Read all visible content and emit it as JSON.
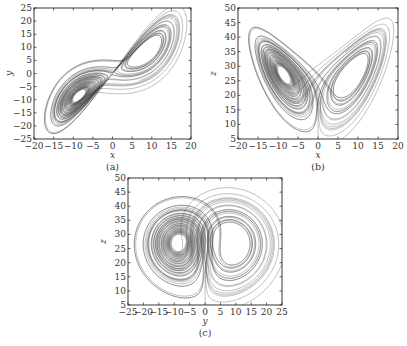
{
  "chart_data": [
    {
      "id": "a",
      "type": "line",
      "title": "",
      "caption": "(a)",
      "xlabel": "x",
      "ylabel": "y",
      "xlim": [
        -20,
        20
      ],
      "ylim": [
        -25,
        25
      ],
      "xticks": [
        -20,
        -15,
        -10,
        -5,
        0,
        5,
        10,
        15,
        20
      ],
      "yticks": [
        -25,
        -20,
        -15,
        -10,
        -5,
        0,
        5,
        10,
        15,
        20,
        25
      ],
      "grid": false,
      "series": [
        {
          "name": "Lorenz attractor projection x-y",
          "x_var": "x",
          "y_var": "y",
          "system": {
            "sigma": 10,
            "rho": 28,
            "beta": 2.6667
          }
        }
      ],
      "frame_px": {
        "left": 34,
        "top": 8,
        "right": 191,
        "bottom": 139
      }
    },
    {
      "id": "b",
      "type": "line",
      "title": "",
      "caption": "(b)",
      "xlabel": "x",
      "ylabel": "z",
      "xlim": [
        -20,
        20
      ],
      "ylim": [
        5,
        50
      ],
      "xticks": [
        -20,
        -15,
        -10,
        -5,
        0,
        5,
        10,
        15,
        20
      ],
      "yticks": [
        5,
        10,
        15,
        20,
        25,
        30,
        35,
        40,
        45,
        50
      ],
      "grid": false,
      "series": [
        {
          "name": "Lorenz attractor projection x-z",
          "x_var": "x",
          "y_var": "z",
          "system": {
            "sigma": 10,
            "rho": 28,
            "beta": 2.6667
          }
        }
      ],
      "frame_px": {
        "left": 238,
        "top": 8,
        "right": 398,
        "bottom": 139
      }
    },
    {
      "id": "c",
      "type": "line",
      "title": "",
      "caption": "(c)",
      "xlabel": "y",
      "ylabel": "z",
      "xlim": [
        -25,
        25
      ],
      "ylim": [
        5,
        50
      ],
      "xticks": [
        -25,
        -20,
        -15,
        -10,
        -5,
        0,
        5,
        10,
        15,
        20,
        25
      ],
      "yticks": [
        5,
        10,
        15,
        20,
        25,
        30,
        35,
        40,
        45,
        50
      ],
      "grid": false,
      "series": [
        {
          "name": "Lorenz attractor projection y-z",
          "x_var": "y",
          "y_var": "z",
          "system": {
            "sigma": 10,
            "rho": 28,
            "beta": 2.6667
          }
        }
      ],
      "frame_px": {
        "left": 128,
        "top": 178,
        "right": 282,
        "bottom": 305
      }
    }
  ],
  "style": {
    "line_color": "#2b2b2b",
    "frame_color": "#222222"
  }
}
